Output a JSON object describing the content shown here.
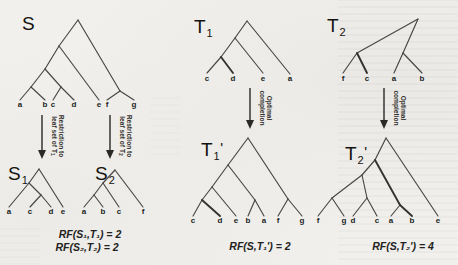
{
  "figure": {
    "trees": {
      "S": {
        "label": {
          "main": "S",
          "sub": "",
          "prime": ""
        },
        "newick": "((((a,b),(c,d)),e),(f,g))",
        "leaves": [
          "a",
          "b",
          "c",
          "d",
          "e",
          "f",
          "g"
        ]
      },
      "T1": {
        "label": {
          "main": "T",
          "sub": "1",
          "prime": ""
        },
        "newick": "(((c,d),e),a)",
        "leaves": [
          "c",
          "d",
          "e",
          "a"
        ]
      },
      "T2": {
        "label": {
          "main": "T",
          "sub": "2",
          "prime": ""
        },
        "newick": "((f,c),(a,b))",
        "leaves": [
          "f",
          "c",
          "a",
          "b"
        ]
      },
      "S1": {
        "label": {
          "main": "S",
          "sub": "1",
          "prime": ""
        },
        "newick": "((a,(c,d)),e)",
        "leaves": [
          "a",
          "c",
          "d",
          "e"
        ]
      },
      "S2": {
        "label": {
          "main": "S",
          "sub": "2",
          "prime": ""
        },
        "newick": "(((a,b),c),f)",
        "leaves": [
          "a",
          "b",
          "c",
          "f"
        ]
      },
      "T1p": {
        "label": {
          "main": "T",
          "sub": "1",
          "prime": "'"
        },
        "newick": "((((c,d),e),(b,a)),(f,g))",
        "leaves": [
          "c",
          "d",
          "e",
          "b",
          "a",
          "f",
          "g"
        ]
      },
      "T2p": {
        "label": {
          "main": "T",
          "sub": "2",
          "prime": "'"
        },
        "newick": "((((f,g),(d,c)),(a,b)),e)",
        "leaves": [
          "f",
          "g",
          "d",
          "c",
          "a",
          "b",
          "e"
        ]
      }
    },
    "arrows": {
      "restriction1": {
        "line1": "Restriction to",
        "line2": "leaf set of T",
        "sub": "1"
      },
      "restriction2": {
        "line1": "Restriction to",
        "line2": "leaf set of T",
        "sub": "2"
      },
      "completion1": {
        "line1": "Optimal",
        "line2": "completion"
      },
      "completion2": {
        "line1": "Optimal",
        "line2": "completion"
      }
    },
    "equations": {
      "rf_s1_t1": "RF(S₁,T₁) = 2",
      "rf_s2_t2": "RF(S₂,T₂) = 2",
      "rf_s_t1p": "RF(S,T₁') = 2",
      "rf_s_t2p": "RF(S,T₂') = 4"
    }
  }
}
